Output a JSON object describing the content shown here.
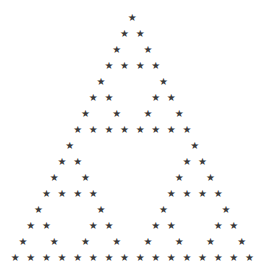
{
  "figure": {
    "kind": "sierpinski-triangle",
    "glyph": "★",
    "glyph_name": "star-icon",
    "color": "#3a3a3a",
    "background": "#ffffff",
    "rows": 16,
    "apex": {
      "x": 132.3,
      "y": 18
    },
    "dx": 15.62,
    "dy": 15.97,
    "rule": "star at (row, k) when (k & (row - k)) == 0",
    "row_counts": [
      1,
      2,
      2,
      4,
      2,
      4,
      4,
      8,
      2,
      4,
      4,
      8,
      4,
      8,
      8,
      16
    ]
  }
}
